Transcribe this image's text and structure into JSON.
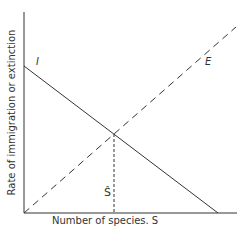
{
  "diagram": {
    "y_axis_label": "Rate of immigration or extinction",
    "x_axis_label": "Number of species. S",
    "curves": [
      {
        "id": "immigration",
        "label": "I",
        "style": "solid",
        "from": [
          0,
          1.0
        ],
        "to": [
          0.91,
          0
        ]
      },
      {
        "id": "extinction",
        "label": "E",
        "style": "dashed",
        "from": [
          0,
          0
        ],
        "to": [
          1.0,
          0.93
        ]
      }
    ],
    "equilibrium_label": "Ŝ",
    "colors": {
      "line": "#333333",
      "background": "#ffffff"
    }
  }
}
